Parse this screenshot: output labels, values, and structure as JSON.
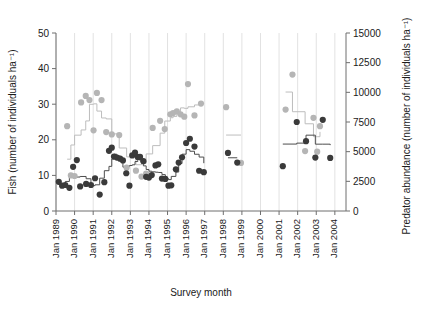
{
  "chart_data": {
    "type": "scatter",
    "title": "",
    "xlabel": "Survey month",
    "ylabel_left": "Fish (number of individuals ha⁻¹)",
    "ylabel_right": "Predator abundance (number of individuals ha⁻¹)",
    "xlim": [
      1989.0,
      2004.6
    ],
    "ylim_left": [
      0,
      50
    ],
    "ylim_right": [
      0,
      15000
    ],
    "grid": "vertical gridlines at each year tick",
    "legend": "none",
    "xticks": [
      "Jan 1989",
      "Jan 1990",
      "Jan 1991",
      "Jan 1992",
      "Jan 1993",
      "Jan 1994",
      "Jan 1995",
      "Jan 1996",
      "Jan 1997",
      "Jan 1998",
      "Jan 1999",
      "Jan 2000",
      "Jan 2001",
      "Jan 2002",
      "Jan 2003",
      "Jan 2004"
    ],
    "xtick_values": [
      1989,
      1990,
      1991,
      1992,
      1993,
      1994,
      1995,
      1996,
      1997,
      1998,
      1999,
      2000,
      2001,
      2002,
      2003,
      2004
    ],
    "yticks_left": [
      0,
      10,
      20,
      30,
      40,
      50
    ],
    "yticks_right": [
      0,
      2500,
      5000,
      7500,
      10000,
      12500,
      15000
    ],
    "series": [
      {
        "name": "Fish (number of individuals per ha)",
        "axis": "left",
        "marker": "filled circle",
        "color": "#3a3a3a",
        "line_color": "#4d4d4d",
        "points": [
          {
            "x": 1989.15,
            "y": 8.2
          },
          {
            "x": 1989.33,
            "y": 7.1
          },
          {
            "x": 1989.5,
            "y": 7.3
          },
          {
            "x": 1989.72,
            "y": 6.5
          },
          {
            "x": 1989.92,
            "y": 12.4
          },
          {
            "x": 1990.12,
            "y": 14.3
          },
          {
            "x": 1990.3,
            "y": 6.9
          },
          {
            "x": 1990.62,
            "y": 7.6
          },
          {
            "x": 1990.88,
            "y": 7.3
          },
          {
            "x": 1991.1,
            "y": 9.2
          },
          {
            "x": 1991.35,
            "y": 4.6
          },
          {
            "x": 1991.6,
            "y": 8.1
          },
          {
            "x": 1991.85,
            "y": 16.9
          },
          {
            "x": 1992.0,
            "y": 17.8
          },
          {
            "x": 1992.12,
            "y": 15.3
          },
          {
            "x": 1992.28,
            "y": 15.0
          },
          {
            "x": 1992.45,
            "y": 14.7
          },
          {
            "x": 1992.6,
            "y": 14.2
          },
          {
            "x": 1992.78,
            "y": 10.6
          },
          {
            "x": 1992.95,
            "y": 7.1
          },
          {
            "x": 1993.1,
            "y": 15.6
          },
          {
            "x": 1993.25,
            "y": 16.4
          },
          {
            "x": 1993.4,
            "y": 15.2
          },
          {
            "x": 1993.52,
            "y": 15.2
          },
          {
            "x": 1993.7,
            "y": 14.0
          },
          {
            "x": 1993.85,
            "y": 9.6
          },
          {
            "x": 1994.0,
            "y": 9.4
          },
          {
            "x": 1994.15,
            "y": 10.1
          },
          {
            "x": 1994.35,
            "y": 12.8
          },
          {
            "x": 1994.5,
            "y": 13.1
          },
          {
            "x": 1994.7,
            "y": 9.1
          },
          {
            "x": 1994.88,
            "y": 9.0
          },
          {
            "x": 1995.05,
            "y": 7.1
          },
          {
            "x": 1995.2,
            "y": 7.2
          },
          {
            "x": 1995.45,
            "y": 11.7
          },
          {
            "x": 1995.6,
            "y": 13.6
          },
          {
            "x": 1995.78,
            "y": 15.1
          },
          {
            "x": 1996.0,
            "y": 19.1
          },
          {
            "x": 1996.2,
            "y": 20.3
          },
          {
            "x": 1996.45,
            "y": 18.1
          },
          {
            "x": 1996.7,
            "y": 11.3
          },
          {
            "x": 1996.95,
            "y": 10.9
          },
          {
            "x": 1998.25,
            "y": 16.3
          },
          {
            "x": 1998.75,
            "y": 13.6
          },
          {
            "x": 2001.2,
            "y": 12.6
          },
          {
            "x": 2001.95,
            "y": 25.0
          },
          {
            "x": 2002.45,
            "y": 19.6
          },
          {
            "x": 2002.95,
            "y": 15.0
          },
          {
            "x": 2003.35,
            "y": 25.6
          },
          {
            "x": 2003.75,
            "y": 14.9
          }
        ]
      },
      {
        "name": "Predator abundance (number of individuals per ha)",
        "axis": "right",
        "marker": "filled circle",
        "color": "#b5b5b5",
        "line_color": "#bdbdbd",
        "points": [
          {
            "x": 1989.6,
            "y": 7150
          },
          {
            "x": 1989.8,
            "y": 3000
          },
          {
            "x": 1990.0,
            "y": 2950
          },
          {
            "x": 1990.35,
            "y": 9150
          },
          {
            "x": 1990.6,
            "y": 9700
          },
          {
            "x": 1990.8,
            "y": 9350
          },
          {
            "x": 1991.02,
            "y": 6800
          },
          {
            "x": 1991.2,
            "y": 9950
          },
          {
            "x": 1991.45,
            "y": 9350
          },
          {
            "x": 1991.7,
            "y": 6650
          },
          {
            "x": 1992.0,
            "y": 6450
          },
          {
            "x": 1992.4,
            "y": 6400
          },
          {
            "x": 1992.8,
            "y": 3650
          },
          {
            "x": 1993.3,
            "y": 3400
          },
          {
            "x": 1993.6,
            "y": 2900
          },
          {
            "x": 1993.85,
            "y": 3150
          },
          {
            "x": 1994.2,
            "y": 7000
          },
          {
            "x": 1994.6,
            "y": 7600
          },
          {
            "x": 1994.85,
            "y": 6900
          },
          {
            "x": 1995.15,
            "y": 8150
          },
          {
            "x": 1995.3,
            "y": 8250
          },
          {
            "x": 1995.5,
            "y": 8400
          },
          {
            "x": 1995.7,
            "y": 8150
          },
          {
            "x": 1995.9,
            "y": 7950
          },
          {
            "x": 1996.1,
            "y": 10700
          },
          {
            "x": 1996.45,
            "y": 8050
          },
          {
            "x": 1996.8,
            "y": 9050
          },
          {
            "x": 1998.15,
            "y": 8750
          },
          {
            "x": 1998.95,
            "y": 4050
          },
          {
            "x": 2001.35,
            "y": 8550
          },
          {
            "x": 2001.72,
            "y": 11500
          },
          {
            "x": 2002.4,
            "y": 5050
          },
          {
            "x": 2002.85,
            "y": 7850
          },
          {
            "x": 2003.2,
            "y": 7150
          },
          {
            "x": 2003.05,
            "y": 5000
          }
        ]
      }
    ],
    "fish_line_path": [
      {
        "x": 1989.1,
        "y": 8.0
      },
      {
        "x": 1989.5,
        "y": 8.0
      },
      {
        "x": 1989.5,
        "y": 7.2
      },
      {
        "x": 1989.9,
        "y": 7.2
      },
      {
        "x": 1989.9,
        "y": 8.2
      },
      {
        "x": 1990.1,
        "y": 8.2
      },
      {
        "x": 1990.1,
        "y": 9.3
      },
      {
        "x": 1990.35,
        "y": 9.3
      },
      {
        "x": 1990.35,
        "y": 8.4
      },
      {
        "x": 1990.55,
        "y": 8.4
      },
      {
        "x": 1990.55,
        "y": 9.1
      },
      {
        "x": 1990.8,
        "y": 9.1
      },
      {
        "x": 1990.8,
        "y": 8.6
      },
      {
        "x": 1991.1,
        "y": 8.6
      },
      {
        "x": 1991.1,
        "y": 8.9
      },
      {
        "x": 1991.35,
        "y": 8.9
      },
      {
        "x": 1991.35,
        "y": 8.0
      },
      {
        "x": 1991.65,
        "y": 8.0
      },
      {
        "x": 1991.65,
        "y": 9.6
      },
      {
        "x": 1991.85,
        "y": 9.6
      },
      {
        "x": 1991.85,
        "y": 14.0
      },
      {
        "x": 1992.1,
        "y": 14.0
      },
      {
        "x": 1992.1,
        "y": 15.4
      },
      {
        "x": 1992.5,
        "y": 15.4
      },
      {
        "x": 1992.5,
        "y": 14.6
      },
      {
        "x": 1992.8,
        "y": 14.6
      },
      {
        "x": 1992.8,
        "y": 14.1
      },
      {
        "x": 1993.1,
        "y": 14.1
      },
      {
        "x": 1993.1,
        "y": 15.5
      },
      {
        "x": 1993.5,
        "y": 15.5
      },
      {
        "x": 1993.5,
        "y": 14.9
      },
      {
        "x": 1993.8,
        "y": 14.9
      },
      {
        "x": 1993.8,
        "y": 12.0
      },
      {
        "x": 1994.0,
        "y": 12.0
      },
      {
        "x": 1994.0,
        "y": 10.3
      },
      {
        "x": 1994.3,
        "y": 10.3
      },
      {
        "x": 1994.3,
        "y": 12.5
      },
      {
        "x": 1994.6,
        "y": 12.5
      },
      {
        "x": 1994.6,
        "y": 11.0
      },
      {
        "x": 1994.9,
        "y": 11.0
      },
      {
        "x": 1994.9,
        "y": 10.4
      },
      {
        "x": 1995.2,
        "y": 10.4
      },
      {
        "x": 1995.2,
        "y": 10.5
      },
      {
        "x": 1995.5,
        "y": 10.5
      },
      {
        "x": 1995.5,
        "y": 12.6
      },
      {
        "x": 1995.8,
        "y": 12.6
      },
      {
        "x": 1995.8,
        "y": 14.3
      },
      {
        "x": 1996.1,
        "y": 14.3
      },
      {
        "x": 1996.1,
        "y": 15.0
      },
      {
        "x": 1996.6,
        "y": 15.0
      },
      {
        "x": 1996.6,
        "y": 13.8
      },
      {
        "x": 1997.0,
        "y": 13.8
      },
      {
        "x": 1997.0,
        "y": 11.2
      },
      {
        "x": 1997.3,
        "y": 11.2
      }
    ]
  },
  "axes": {
    "left_title": "Fish (number of individuals ha⁻¹)",
    "right_title": "Predator abundance (number of individuals ha⁻¹)",
    "bottom_title": "Survey month"
  },
  "colors": {
    "fish_marker": "#3a3a3a",
    "predator_marker": "#b5b5b5",
    "fish_line": "#4d4d4d",
    "predator_line": "#bdbdbd",
    "grid": "#e2e2e2",
    "axis": "#6e6e6e",
    "text": "#1a1a1a",
    "background": "#ffffff"
  }
}
